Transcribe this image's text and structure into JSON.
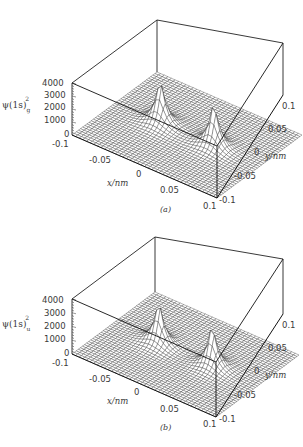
{
  "chart_data": [
    {
      "type": "surface3d",
      "panel": "(a)",
      "title": "",
      "zlabel": "ψ(1s)g²",
      "zlabel_parts": {
        "base": "ψ(1s)",
        "sub": "g",
        "sup": "2"
      },
      "xlabel": "x/nm",
      "ylabel": "y/nm",
      "zlim": [
        0,
        4000
      ],
      "z_ticks": [
        "4000",
        "3000",
        "2000",
        "1000",
        "0"
      ],
      "x_ticks": [
        "-0.1",
        "-0.05",
        "0",
        "0.05",
        "0.1"
      ],
      "y_ticks": [
        "0.1",
        "0.05",
        "0",
        "-0.05",
        "-0.1"
      ],
      "xlim": [
        -0.1,
        0.1
      ],
      "ylim": [
        -0.1,
        0.1
      ],
      "grid": true,
      "description": "Bonding orbital density: two nuclear cusps along x at about ±0.037 nm with density filled in between (peak ≈ 3700)",
      "peaks": [
        {
          "x": -0.037,
          "y": 0,
          "height": 3700
        },
        {
          "x": 0.037,
          "y": 0,
          "height": 3700
        }
      ],
      "symmetry": "gerade"
    },
    {
      "type": "surface3d",
      "panel": "(b)",
      "title": "",
      "zlabel": "ψ(1s)u²",
      "zlabel_parts": {
        "base": "ψ(1s)",
        "sub": "u",
        "sup": "2"
      },
      "xlabel": "x/nm",
      "ylabel": "y/nm",
      "zlim": [
        0,
        4000
      ],
      "z_ticks": [
        "4000",
        "3000",
        "2000",
        "1000",
        "0"
      ],
      "x_ticks": [
        "-0.1",
        "-0.05",
        "0",
        "0.05",
        "0.1"
      ],
      "y_ticks": [
        "0.1",
        "0.05",
        "0",
        "-0.05",
        "-0.1"
      ],
      "xlim": [
        -0.1,
        0.1
      ],
      "ylim": [
        -0.1,
        0.1
      ],
      "grid": true,
      "description": "Antibonding orbital density: two sharp cusps at about ±0.037 nm with a node (zero density) at x = 0 (peak ≈ 3300)",
      "peaks": [
        {
          "x": -0.037,
          "y": 0,
          "height": 3300
        },
        {
          "x": 0.037,
          "y": 0,
          "height": 3300
        }
      ],
      "symmetry": "ungerade"
    }
  ],
  "panels": [
    {
      "caption": "(a)",
      "zsub": "g"
    },
    {
      "caption": "(b)",
      "zsub": "u"
    }
  ]
}
